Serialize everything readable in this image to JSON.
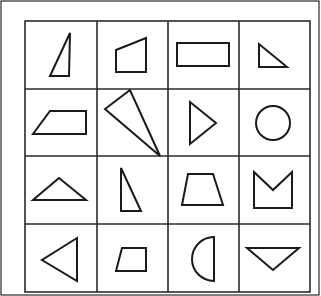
{
  "figure": {
    "rows": 4,
    "cols": 4,
    "stroke_color": "#1a1a1a",
    "background": "#ffffff",
    "cells": [
      {
        "row": 1,
        "col": 1,
        "shape": "right-triangle-tall"
      },
      {
        "row": 1,
        "col": 2,
        "shape": "quadrilateral-slanted-top"
      },
      {
        "row": 1,
        "col": 3,
        "shape": "rectangle"
      },
      {
        "row": 1,
        "col": 4,
        "shape": "right-triangle-small"
      },
      {
        "row": 2,
        "col": 1,
        "shape": "trapezoid-left-slant"
      },
      {
        "row": 2,
        "col": 2,
        "shape": "scalene-triangle-large"
      },
      {
        "row": 2,
        "col": 3,
        "shape": "triangle-pointing-right"
      },
      {
        "row": 2,
        "col": 4,
        "shape": "circle"
      },
      {
        "row": 3,
        "col": 1,
        "shape": "isosceles-triangle-wide"
      },
      {
        "row": 3,
        "col": 2,
        "shape": "right-triangle-narrow"
      },
      {
        "row": 3,
        "col": 3,
        "shape": "isosceles-trapezoid"
      },
      {
        "row": 3,
        "col": 4,
        "shape": "notched-pentagon"
      },
      {
        "row": 4,
        "col": 1,
        "shape": "triangle-pointing-left"
      },
      {
        "row": 4,
        "col": 2,
        "shape": "trapezoid-small"
      },
      {
        "row": 4,
        "col": 3,
        "shape": "semicircle"
      },
      {
        "row": 4,
        "col": 4,
        "shape": "triangle-pointing-down"
      }
    ]
  }
}
